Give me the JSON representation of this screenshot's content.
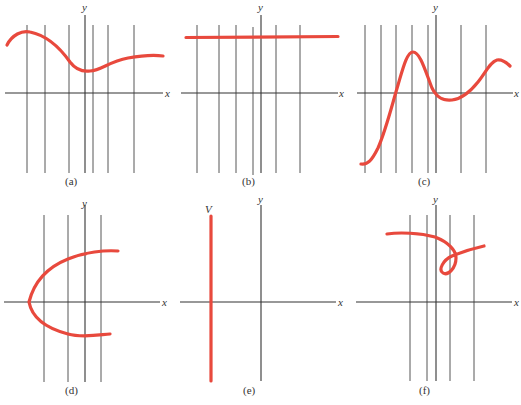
{
  "figure": {
    "accent_color": "#e8493d",
    "panels": [
      {
        "id": "a",
        "caption": "(a)",
        "x_label": "x",
        "y_label": "y",
        "description": "smooth wavy curve, function graph"
      },
      {
        "id": "b",
        "caption": "(b)",
        "x_label": "x",
        "y_label": "y",
        "description": "horizontal line, function graph"
      },
      {
        "id": "c",
        "caption": "(c)",
        "x_label": "x",
        "y_label": "y",
        "description": "oscillating curve crossing x-axis, function graph"
      },
      {
        "id": "d",
        "caption": "(d)",
        "x_label": "x",
        "y_label": "y",
        "description": "sideways parabola opening right, fails vertical line test"
      },
      {
        "id": "e",
        "caption": "(e)",
        "x_label": "x",
        "y_label": "y",
        "curve_label": "V",
        "description": "vertical line, fails vertical line test"
      },
      {
        "id": "f",
        "caption": "(f)",
        "x_label": "x",
        "y_label": "y",
        "description": "curve with loop, fails vertical line test"
      }
    ]
  }
}
